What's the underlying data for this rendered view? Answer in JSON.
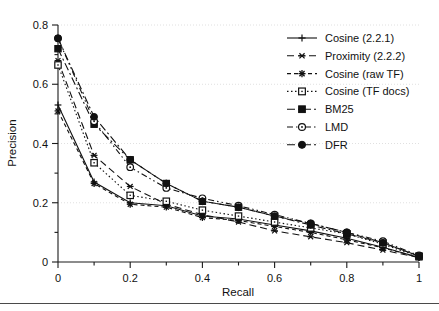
{
  "chart_data": {
    "type": "line",
    "title": "",
    "xlabel": "Recall",
    "ylabel": "Precision",
    "xlim": [
      0,
      1
    ],
    "ylim": [
      0,
      0.8
    ],
    "x_ticks": [
      0,
      0.2,
      0.4,
      0.6,
      0.8,
      1
    ],
    "x_tick_labels": [
      "0",
      "0.2",
      "0.4",
      "0.6",
      "0.8",
      "1"
    ],
    "x_minor_ticks": [
      0.1,
      0.3,
      0.5,
      0.7,
      0.9
    ],
    "y_ticks": [
      0,
      0.2,
      0.4,
      0.6,
      0.8
    ],
    "y_tick_labels": [
      "0",
      "0.2",
      "0.4",
      "0.6",
      "0.8"
    ],
    "y_minor_ticks": [
      0.1,
      0.3,
      0.5,
      0.7
    ],
    "grid": "dotted horizontal gridlines at major y ticks",
    "legend_position": "top-right inside plot",
    "x": [
      0,
      0.1,
      0.2,
      0.3,
      0.4,
      0.5,
      0.6,
      0.7,
      0.8,
      0.9,
      1
    ],
    "series": [
      {
        "name": "Cosine (2.2.1)",
        "marker": "plus",
        "dash": "solid",
        "values": [
          0.53,
          0.27,
          0.2,
          0.19,
          0.155,
          0.145,
          0.125,
          0.105,
          0.08,
          0.05,
          0.015
        ]
      },
      {
        "name": "Proximity (2.2.2)",
        "marker": "star6",
        "dash": "dashed-long",
        "values": [
          0.68,
          0.36,
          0.255,
          0.195,
          0.16,
          0.135,
          0.105,
          0.085,
          0.065,
          0.04,
          0.015
        ]
      },
      {
        "name": "Cosine (raw TF)",
        "marker": "asterisk",
        "dash": "dash-short",
        "values": [
          0.51,
          0.265,
          0.195,
          0.185,
          0.15,
          0.14,
          0.12,
          0.1,
          0.075,
          0.048,
          0.015
        ]
      },
      {
        "name": "Cosine (TF docs)",
        "marker": "square-open",
        "dash": "dotted",
        "values": [
          0.665,
          0.335,
          0.225,
          0.205,
          0.175,
          0.155,
          0.135,
          0.115,
          0.095,
          0.06,
          0.018
        ]
      },
      {
        "name": "BM25",
        "marker": "square-filled",
        "dash": "dash-dot",
        "values": [
          0.72,
          0.465,
          0.345,
          0.265,
          0.205,
          0.185,
          0.155,
          0.125,
          0.095,
          0.065,
          0.02
        ]
      },
      {
        "name": "LMD",
        "marker": "circle-open",
        "dash": "dash-dot-dot",
        "values": [
          0.755,
          0.475,
          0.32,
          0.25,
          0.215,
          0.19,
          0.16,
          0.13,
          0.1,
          0.07,
          0.022
        ]
      },
      {
        "name": "DFR",
        "marker": "circle-filled",
        "dash": "dash-dot",
        "values": [
          0.755,
          0.49,
          0.345,
          0.265,
          0.205,
          0.185,
          0.155,
          0.13,
          0.1,
          0.065,
          0.02
        ]
      }
    ],
    "colors": {
      "ink": "#111111",
      "grid": "#d8d8d8",
      "background": "#ffffff"
    }
  }
}
